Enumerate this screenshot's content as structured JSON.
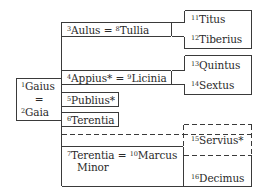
{
  "diagram": {
    "type": "family-tree",
    "root": {
      "line1_num": "1",
      "line1_name": "Gaius",
      "eq": "=",
      "line2_num": "2",
      "line2_name": "Gaia"
    },
    "children": [
      {
        "num_a": "3",
        "name_a": "Aulus",
        "eq": "=",
        "num_b": "8",
        "name_b": "Tullia"
      },
      {
        "num_a": "4",
        "name_a": "Appius*",
        "eq": "=",
        "num_b": "9",
        "name_b": "Licinia"
      },
      {
        "num_a": "5",
        "name_a": "Publius*"
      },
      {
        "num_a": "6",
        "name_a": "Terentia"
      },
      {
        "num_a": "7",
        "name_a": "Terentia",
        "eq": "=",
        "num_b": "10",
        "name_b": "Marcus",
        "line2": "Minor"
      }
    ],
    "grandchildren": [
      {
        "num": "11",
        "name": "Titus"
      },
      {
        "num": "12",
        "name": "Tiberius"
      },
      {
        "num": "13",
        "name": "Quintus"
      },
      {
        "num": "14",
        "name": "Sextus"
      },
      {
        "num": "15",
        "name": "Servius*"
      },
      {
        "num": "16",
        "name": "Decimus"
      }
    ],
    "line_color": "#3a3a3a"
  }
}
